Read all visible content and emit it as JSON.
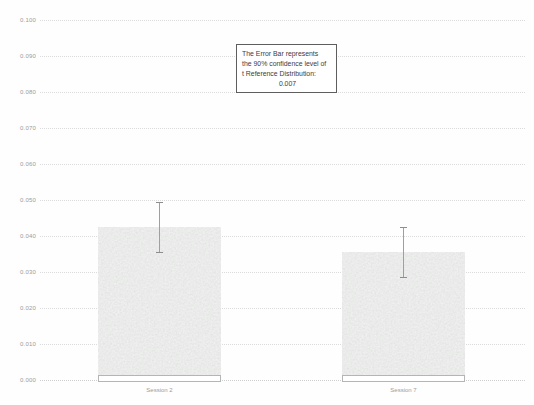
{
  "chart_data": {
    "type": "bar",
    "title": "",
    "xlabel": "",
    "ylabel": "",
    "categories": [
      "Session 2",
      "Session 7"
    ],
    "values": [
      0.0425,
      0.0355
    ],
    "error": 0.007,
    "ylim": [
      0,
      0.1
    ],
    "ytick_step": 0.01,
    "yticks": [
      "0.100",
      "0.090",
      "0.080",
      "0.070",
      "0.060",
      "0.050",
      "0.040",
      "0.030",
      "0.020",
      "0.010",
      "0.000"
    ],
    "grid": "horizontal-dotted",
    "legend": "none",
    "annotation": {
      "lines": [
        "The Error Bar represents",
        "the 90% confidence level of",
        "t Reference Distribution:"
      ],
      "value": "0.007"
    },
    "colors": {
      "bar_fill": "#c6c8c7",
      "bar_base_border": "#b4b6b5",
      "error_bar": "#9f9f9f",
      "gridline": "#dbdbdb",
      "tick_label": "#9b9b9b",
      "annotation_border": "#5e5e5e",
      "annotation_text": "#3c3c3c",
      "background": "#fefefe"
    }
  }
}
